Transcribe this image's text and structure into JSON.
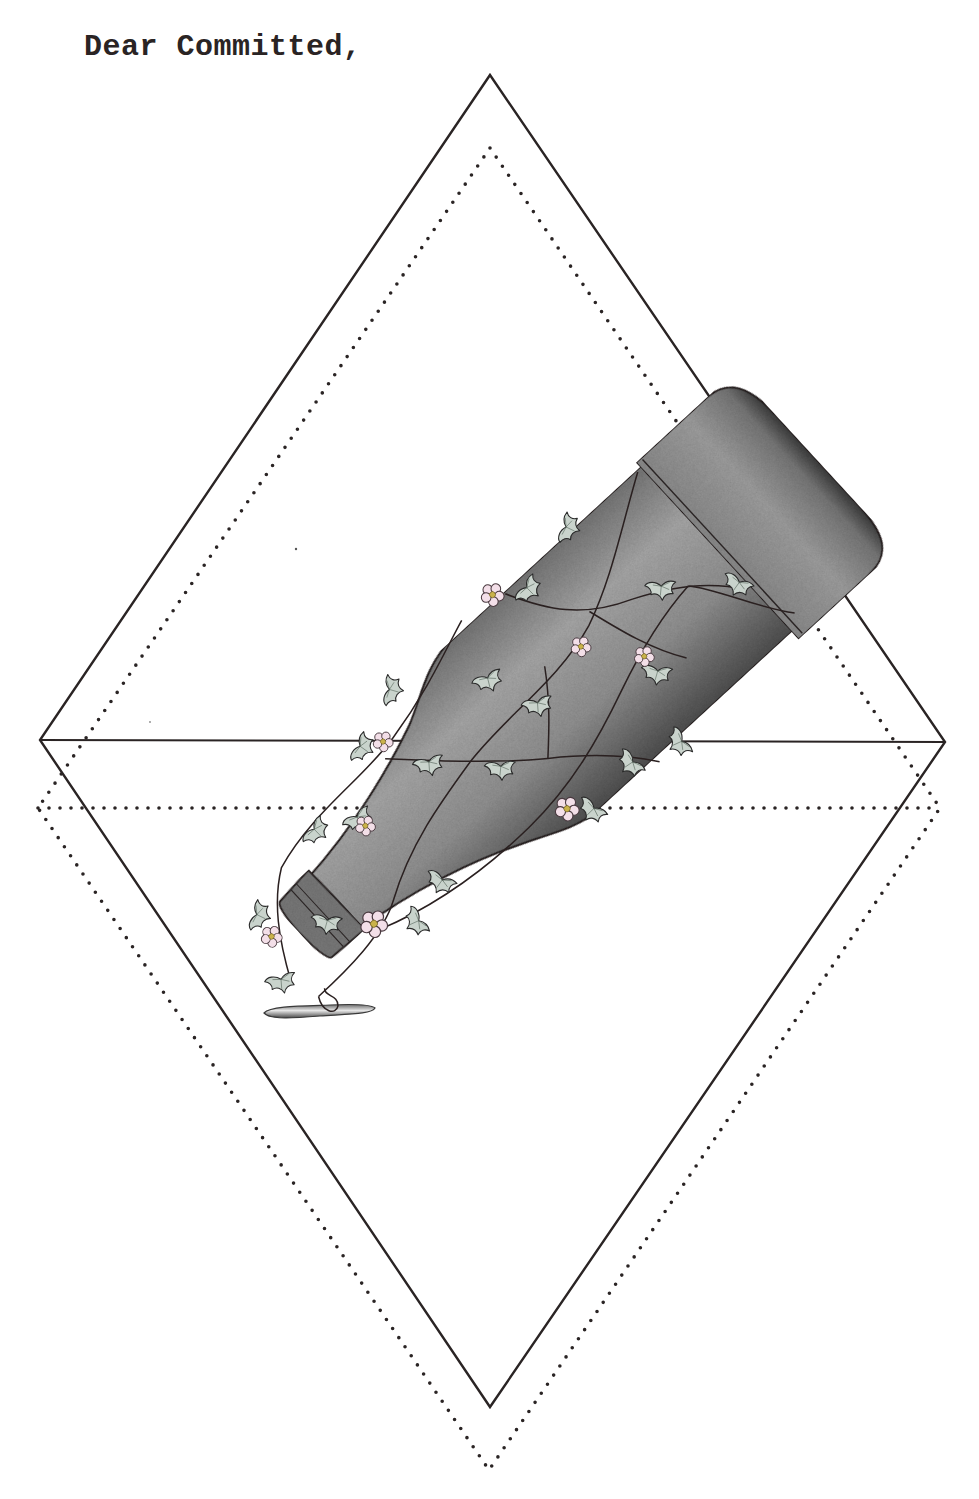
{
  "letter": {
    "greeting": "Dear Committed,"
  },
  "illustration": {
    "subject": "tilted glass bottle wrapped in ivy vine with small pink flowers, resting inside overlapping diamond frames",
    "frames": [
      {
        "style": "solid",
        "points": [
          [
            490,
            75
          ],
          [
            945,
            742
          ],
          [
            490,
            1407
          ],
          [
            40,
            740
          ]
        ]
      },
      {
        "style": "dotted",
        "points": [
          [
            490,
            148
          ],
          [
            940,
            808
          ],
          [
            489,
            1470
          ],
          [
            38,
            808
          ]
        ]
      }
    ],
    "colors": {
      "ink": "#2a2424",
      "bottle_light": "#a8a8a8",
      "bottle_dark": "#4a4a4a",
      "leaf": "#c9d3cc",
      "flower": "#f3dfe8",
      "flower_center": "#c9b24a"
    }
  }
}
